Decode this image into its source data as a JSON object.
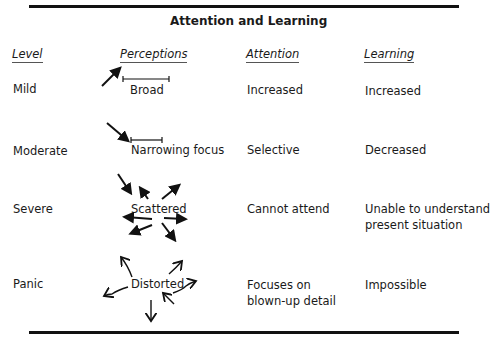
{
  "title": "Attention and Learning",
  "headers": {
    "level": "Level",
    "perceptions": "Perceptions",
    "attention": "Attention",
    "learning": "Learning"
  },
  "rows": [
    {
      "level": "Mild",
      "perception": "Broad",
      "attention": "Increased",
      "learning": "Increased",
      "arrow_icon": "single-arrow-up-right"
    },
    {
      "level": "Moderate",
      "perception": "Narrowing focus",
      "attention": "Selective",
      "learning": "Decreased",
      "arrow_icon": "single-arrow-down-right"
    },
    {
      "level": "Severe",
      "perception": "Scattered",
      "attention": "Cannot attend",
      "learning_line1": "Unable to understand",
      "learning_line2": "present situation",
      "arrow_icon": "scattered-arrows"
    },
    {
      "level": "Panic",
      "perception": "Distorted",
      "attention_line1": "Focuses on",
      "attention_line2": "blown-up detail",
      "learning": "Impossible",
      "arrow_icon": "wavy-arrows"
    }
  ]
}
